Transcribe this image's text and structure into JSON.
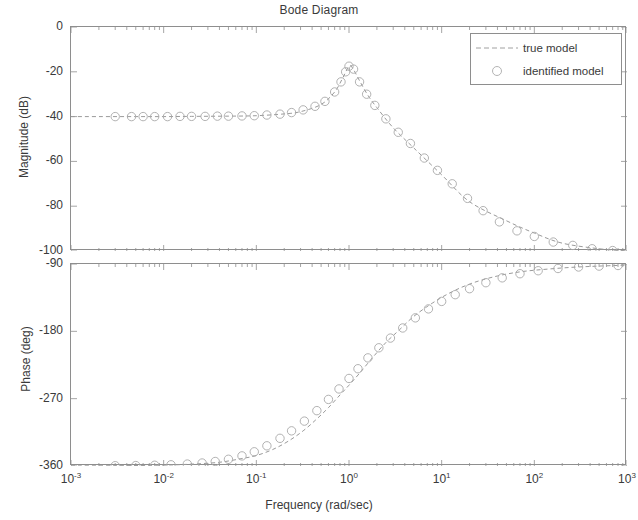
{
  "figure": {
    "title": "Bode Diagram",
    "xlabel": "Frequency  (rad/sec)",
    "mag_ylabel": "Magnitude (dB)",
    "phase_ylabel": "Phase (deg)"
  },
  "legend": {
    "true_model": "true model",
    "identified_model": "identified model"
  },
  "ticks": {
    "mag_y": [
      "0",
      "-20",
      "-40",
      "-60",
      "-80",
      "-100"
    ],
    "phase_y": [
      "-90",
      "-180",
      "-270",
      "-360"
    ],
    "x_mantissa": [
      "10",
      "10",
      "10",
      "10",
      "10",
      "10",
      "10"
    ],
    "x_exponent": [
      "-3",
      "-2",
      "-1",
      "0",
      "1",
      "2",
      "3"
    ]
  },
  "colors": {
    "frame": "#8e8e8e",
    "text": "#3a3a3a",
    "true_curve": "#9a9a9a",
    "identified_marker": "#a8a8a8",
    "background": "#ffffff"
  },
  "chart_data": {
    "type": "line",
    "title": "Bode Diagram",
    "xlabel": "Frequency  (rad/sec)",
    "xscale": "log",
    "xlim": [
      0.001,
      1000
    ],
    "xticks": [
      0.001,
      0.01,
      0.1,
      1,
      10,
      100,
      1000
    ],
    "subplots": [
      {
        "name": "magnitude",
        "ylabel": "Magnitude (dB)",
        "ylim": [
          -100,
          0
        ],
        "yticks": [
          0,
          -20,
          -40,
          -60,
          -80,
          -100
        ],
        "grid": false,
        "series": [
          {
            "name": "true model",
            "style": "dashed",
            "x": [
              0.001,
              0.002,
              0.005,
              0.01,
              0.02,
              0.05,
              0.1,
              0.2,
              0.3,
              0.5,
              0.7,
              0.85,
              1.0,
              1.1,
              1.3,
              1.6,
              2.0,
              3.0,
              5.0,
              10.0,
              20.0,
              50.0,
              100.0,
              200.0,
              500.0,
              1000.0
            ],
            "y": [
              -40.0,
              -40.0,
              -40.0,
              -40.0,
              -39.9,
              -39.8,
              -39.6,
              -38.8,
              -37.8,
              -34.6,
              -29.0,
              -23.0,
              -17.5,
              -18.5,
              -24.0,
              -30.5,
              -36.0,
              -45.0,
              -54.0,
              -66.0,
              -78.0,
              -86.5,
              -92.0,
              -96.5,
              -99.0,
              -100.0
            ]
          },
          {
            "name": "identified model",
            "style": "circles",
            "x": [
              0.003,
              0.0045,
              0.006,
              0.008,
              0.011,
              0.015,
              0.02,
              0.028,
              0.038,
              0.05,
              0.07,
              0.095,
              0.13,
              0.18,
              0.24,
              0.32,
              0.43,
              0.55,
              0.7,
              0.82,
              0.92,
              1.0,
              1.12,
              1.3,
              1.55,
              1.9,
              2.5,
              3.4,
              4.6,
              6.5,
              9.0,
              13.0,
              19.0,
              28.0,
              42.0,
              65.0,
              100.0,
              160.0,
              260.0,
              420.0,
              700.0
            ],
            "y": [
              -40.0,
              -40.0,
              -40.0,
              -40.0,
              -40.0,
              -39.9,
              -39.9,
              -39.9,
              -39.8,
              -39.8,
              -39.7,
              -39.6,
              -39.3,
              -38.9,
              -38.2,
              -37.0,
              -35.4,
              -33.2,
              -29.0,
              -24.5,
              -20.0,
              -17.5,
              -18.8,
              -24.5,
              -30.0,
              -35.0,
              -41.0,
              -47.0,
              -52.0,
              -58.5,
              -64.0,
              -70.0,
              -76.5,
              -82.0,
              -87.0,
              -91.0,
              -93.5,
              -96.0,
              -97.5,
              -99.0,
              -99.8
            ]
          }
        ]
      },
      {
        "name": "phase",
        "ylabel": "Phase (deg)",
        "ylim": [
          -360,
          -90
        ],
        "yticks": [
          -90,
          -180,
          -270,
          -360
        ],
        "grid": false,
        "series": [
          {
            "name": "true model",
            "style": "dashed",
            "x": [
              0.001,
              0.003,
              0.01,
              0.02,
              0.04,
              0.07,
              0.1,
              0.15,
              0.22,
              0.32,
              0.45,
              0.6,
              0.8,
              1.0,
              1.3,
              1.8,
              2.5,
              3.5,
              5.0,
              8.0,
              13.0,
              22.0,
              40.0,
              70.0,
              120.0,
              250.0,
              500.0,
              1000.0
            ],
            "y": [
              -359.8,
              -359.6,
              -358.8,
              -357.5,
              -355.0,
              -350.0,
              -346.0,
              -338.0,
              -327.0,
              -313.0,
              -297.0,
              -282.0,
              -265.0,
              -252.0,
              -236.0,
              -215.0,
              -195.0,
              -178.0,
              -160.0,
              -142.0,
              -127.0,
              -115.0,
              -106.0,
              -100.5,
              -97.5,
              -94.5,
              -92.8,
              -91.5
            ]
          },
          {
            "name": "identified model",
            "style": "circles",
            "x": [
              0.003,
              0.005,
              0.008,
              0.012,
              0.018,
              0.026,
              0.036,
              0.05,
              0.07,
              0.095,
              0.13,
              0.18,
              0.24,
              0.33,
              0.45,
              0.6,
              0.78,
              1.0,
              1.25,
              1.6,
              2.1,
              2.8,
              3.8,
              5.2,
              7.2,
              10.0,
              14.0,
              20.0,
              30.0,
              45.0,
              70.0,
              110.0,
              180.0,
              300.0,
              500.0,
              800.0
            ],
            "y": [
              -359.6,
              -359.4,
              -359.0,
              -358.4,
              -357.4,
              -356.0,
              -354.0,
              -351.0,
              -346.5,
              -341.0,
              -333.0,
              -323.0,
              -313.0,
              -300.0,
              -286.0,
              -271.0,
              -257.0,
              -243.0,
              -230.0,
              -215.5,
              -202.0,
              -189.0,
              -175.5,
              -162.0,
              -150.0,
              -140.0,
              -131.0,
              -123.0,
              -115.0,
              -108.5,
              -103.0,
              -99.0,
              -96.0,
              -94.0,
              -92.8,
              -92.0
            ]
          }
        ]
      }
    ]
  }
}
